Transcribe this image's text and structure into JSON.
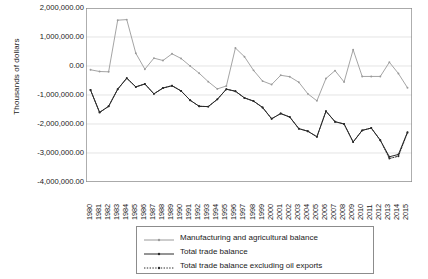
{
  "chart_data": {
    "type": "line",
    "title": "",
    "xlabel": "",
    "ylabel": "Thousands of dollars",
    "ylim": [
      -4000000,
      2000000
    ],
    "ytick_labels": [
      "2,000,000.00",
      "1,000,000.00",
      "0.00",
      "-1,000,000.00",
      "-2,000,000.00",
      "-3,000,000.00",
      "-4,000,000.00"
    ],
    "ytick_values": [
      2000000,
      1000000,
      0,
      -1000000,
      -2000000,
      -3000000,
      -4000000
    ],
    "grid": true,
    "legend_position": "bottom",
    "categories": [
      "1980",
      "1981",
      "1982",
      "1983",
      "1984",
      "1985",
      "1986",
      "1987",
      "1988",
      "1989",
      "1990",
      "1991",
      "1992",
      "1993",
      "1994",
      "1995",
      "1996",
      "1997",
      "1998",
      "1999",
      "2000",
      "2001",
      "2002",
      "2003",
      "2004",
      "2005",
      "2006",
      "2007",
      "2008",
      "2009",
      "2010",
      "2011",
      "2012",
      "2013",
      "2014",
      "2015"
    ],
    "series": [
      {
        "name": "Manufacturing and agricultural balance",
        "color": "#9a9a9a",
        "style": "solid",
        "marker": "dot",
        "values": [
          -130000,
          -190000,
          -200000,
          1580000,
          1600000,
          440000,
          -110000,
          270000,
          190000,
          420000,
          260000,
          0,
          -250000,
          -540000,
          -790000,
          -690000,
          620000,
          320000,
          -150000,
          -520000,
          -640000,
          -320000,
          -370000,
          -560000,
          -960000,
          -1200000,
          -430000,
          -160000,
          -550000,
          560000,
          -360000,
          -360000,
          -360000,
          130000,
          -260000,
          -750000
        ]
      },
      {
        "name": "Total trade balance",
        "color": "#2b2b2b",
        "style": "solid",
        "marker": "dot",
        "values": [
          -830000,
          -1600000,
          -1390000,
          -800000,
          -420000,
          -720000,
          -620000,
          -960000,
          -760000,
          -680000,
          -860000,
          -1180000,
          -1390000,
          -1400000,
          -1150000,
          -800000,
          -870000,
          -1100000,
          -1210000,
          -1430000,
          -1820000,
          -1640000,
          -1760000,
          -2160000,
          -2250000,
          -2440000,
          -1560000,
          -1920000,
          -2000000,
          -2620000,
          -2220000,
          -2140000,
          -2560000,
          -3130000,
          -3050000,
          -2280000
        ]
      },
      {
        "name": "Total trade balance excluding oil exports",
        "color": "#2b2b2b",
        "style": "dotted",
        "marker": "dot",
        "values": [
          -830000,
          -1600000,
          -1390000,
          -800000,
          -420000,
          -720000,
          -620000,
          -960000,
          -760000,
          -680000,
          -860000,
          -1180000,
          -1390000,
          -1400000,
          -1150000,
          -800000,
          -870000,
          -1100000,
          -1210000,
          -1430000,
          -1820000,
          -1640000,
          -1760000,
          -2160000,
          -2250000,
          -2440000,
          -1560000,
          -1920000,
          -2000000,
          -2620000,
          -2220000,
          -2140000,
          -2560000,
          -3190000,
          -3110000,
          -2300000
        ]
      }
    ]
  },
  "legend": {
    "items": [
      {
        "label": "Manufacturing and agricultural balance"
      },
      {
        "label": "Total trade balance"
      },
      {
        "label": "Total trade balance excluding oil exports"
      }
    ]
  }
}
